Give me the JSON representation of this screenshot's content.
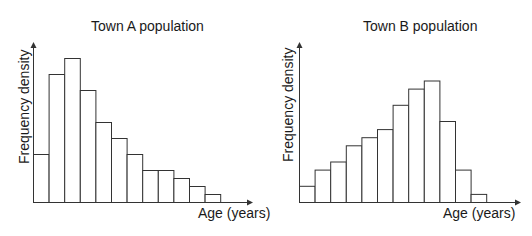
{
  "chart_data": [
    {
      "type": "bar",
      "subtype": "histogram",
      "title": "Town A population",
      "xlabel": "Age (years)",
      "ylabel": "Frequency density",
      "categories": [
        "1",
        "2",
        "3",
        "4",
        "5",
        "6",
        "7",
        "8",
        "9",
        "10",
        "11",
        "12"
      ],
      "values": [
        6,
        16,
        18,
        14,
        10,
        8,
        6,
        4,
        4,
        3,
        2,
        1
      ],
      "ylim": [
        0,
        20
      ],
      "grid": false,
      "tick_labels": false,
      "bar_color": "#ffffff",
      "edge_color": "#333333"
    },
    {
      "type": "bar",
      "subtype": "histogram",
      "title": "Town B population",
      "xlabel": "Age (years)",
      "ylabel": "Frequency density",
      "categories": [
        "1",
        "2",
        "3",
        "4",
        "5",
        "6",
        "7",
        "8",
        "9",
        "10",
        "11",
        "12"
      ],
      "values": [
        2,
        4,
        5,
        7,
        8,
        9,
        12,
        14,
        15,
        10,
        4,
        1
      ],
      "ylim": [
        0,
        20
      ],
      "grid": false,
      "tick_labels": false,
      "bar_color": "#ffffff",
      "edge_color": "#333333"
    }
  ]
}
